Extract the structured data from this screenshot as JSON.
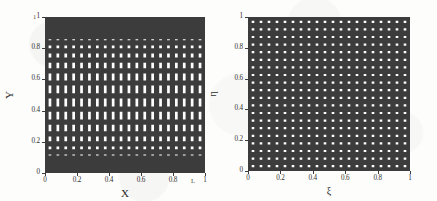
{
  "figure": {
    "background_color": "#ffffff",
    "line_color": "#3c3c3c",
    "text_color": "#2b2b2b"
  },
  "chart_data": [
    {
      "type": "line",
      "id": "physical-grid",
      "title": "",
      "xlabel": "X",
      "ylabel": "Y",
      "xlim": [
        0,
        1
      ],
      "ylim": [
        0,
        1
      ],
      "grid": true,
      "legend": "none",
      "description": "Physical domain structured mesh, uniform in X, clustered toward the Y = 0 and Y = 1 walls",
      "xticks": [
        0,
        0.2,
        0.4,
        0.6,
        0.8,
        1
      ],
      "xticklabels": [
        "0",
        "0.2",
        "0.4",
        "0.6",
        "0.8",
        "1"
      ],
      "yticks": [
        0,
        0.2,
        0.4,
        0.6,
        0.8,
        1
      ],
      "yticklabels": [
        "0",
        "0.2",
        "0.4",
        "0.6",
        "0.8",
        "1"
      ],
      "corner_label_top_left": "1",
      "corner_label_bottom_right": "L",
      "x_gridlines": [
        0,
        0.05,
        0.1,
        0.15,
        0.2,
        0.25,
        0.3,
        0.35,
        0.4,
        0.45,
        0.5,
        0.55,
        0.6,
        0.65,
        0.7,
        0.75,
        0.8,
        0.85,
        0.9,
        0.95,
        1
      ],
      "y_gridlines": [
        0,
        0.004,
        0.009,
        0.016,
        0.026,
        0.041,
        0.062,
        0.091,
        0.131,
        0.183,
        0.248,
        0.324,
        0.408,
        0.494,
        0.578,
        0.657,
        0.727,
        0.787,
        0.838,
        0.879,
        0.912,
        0.938,
        0.958,
        0.973,
        0.984,
        0.991,
        0.996,
        1
      ]
    },
    {
      "type": "line",
      "id": "computational-grid",
      "title": "",
      "xlabel": "ξ",
      "ylabel": "η",
      "xlim": [
        0,
        1
      ],
      "ylim": [
        0,
        1
      ],
      "grid": true,
      "legend": "none",
      "description": "Computational domain uniform structured mesh in the transformed coordinates xi and eta",
      "xticks": [
        0,
        0.2,
        0.4,
        0.6,
        0.8,
        1
      ],
      "xticklabels": [
        "0",
        "0.2",
        "0.4",
        "0.6",
        "0.8",
        "1"
      ],
      "yticks": [
        0,
        0.2,
        0.4,
        0.6,
        0.8,
        1
      ],
      "yticklabels": [
        "0",
        "0.2",
        "0.4",
        "0.6",
        "0.8",
        "1"
      ],
      "x_gridlines": [
        0,
        0.05,
        0.1,
        0.15,
        0.2,
        0.25,
        0.3,
        0.35,
        0.4,
        0.45,
        0.5,
        0.55,
        0.6,
        0.65,
        0.7,
        0.75,
        0.8,
        0.85,
        0.9,
        0.95,
        1
      ],
      "y_gridlines": [
        0,
        0.05,
        0.1,
        0.15,
        0.2,
        0.25,
        0.3,
        0.35,
        0.4,
        0.45,
        0.5,
        0.55,
        0.6,
        0.65,
        0.7,
        0.75,
        0.8,
        0.85,
        0.9,
        0.95,
        1
      ]
    }
  ]
}
